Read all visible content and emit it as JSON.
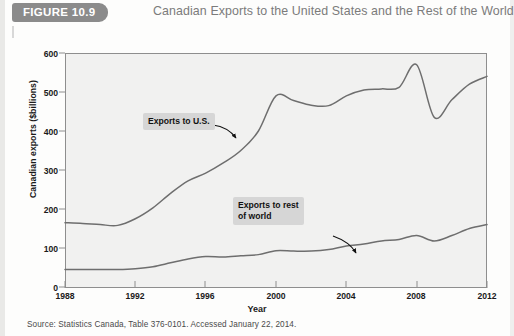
{
  "header": {
    "badge": "FIGURE 10.9",
    "title": "Canadian Exports to the United States and the Rest of the World"
  },
  "source": "Source: Statistics Canada, Table 376-0101. Accessed January 22, 2014.",
  "annotations": {
    "us": "Exports to U.S.",
    "row_line1": "Exports to rest",
    "row_line2": "of world"
  },
  "colors": {
    "badge_bg": "#8b8b8b",
    "title_text": "#7b7b7b",
    "plot_bg": "#f1f1f0",
    "line": "#6e6e6e",
    "callout_bg": "#d6d6d6",
    "axis": "#8e8e8e"
  },
  "chart_data": {
    "type": "line",
    "title": "Canadian Exports to the United States and the Rest of the World",
    "xlabel": "Year",
    "ylabel": "Canadian exports ($billions)",
    "xlim": [
      1988,
      2012
    ],
    "ylim": [
      0,
      600
    ],
    "yticks": [
      0,
      100,
      200,
      300,
      400,
      500,
      600
    ],
    "xticks": [
      1988,
      1992,
      1996,
      2000,
      2004,
      2008,
      2012
    ],
    "grid": false,
    "legend": "annotations",
    "x": [
      1988,
      1989,
      1990,
      1991,
      1992,
      1993,
      1994,
      1995,
      1996,
      1997,
      1998,
      1999,
      2000,
      2001,
      2002,
      2003,
      2004,
      2005,
      2006,
      2007,
      2008,
      2009,
      2010,
      2011,
      2012
    ],
    "series": [
      {
        "name": "Exports to U.S.",
        "values": [
          165,
          163,
          160,
          158,
          175,
          203,
          240,
          272,
          292,
          318,
          350,
          400,
          490,
          478,
          466,
          465,
          490,
          505,
          508,
          512,
          570,
          435,
          480,
          520,
          540
        ]
      },
      {
        "name": "Exports to rest of world",
        "values": [
          45,
          45,
          45,
          45,
          47,
          52,
          62,
          72,
          78,
          77,
          80,
          83,
          93,
          92,
          92,
          96,
          105,
          110,
          118,
          122,
          132,
          118,
          132,
          150,
          160
        ]
      }
    ]
  }
}
